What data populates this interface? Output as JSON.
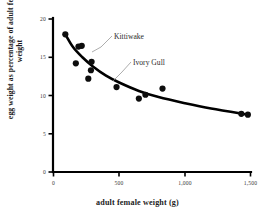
{
  "chart_data": {
    "type": "scatter",
    "title": "",
    "xlabel": "adult female weight (g)",
    "ylabel": "egg weight as percentage of adult female weight",
    "xlim": [
      0,
      1500
    ],
    "ylim": [
      0,
      20
    ],
    "xticks": [
      0,
      500,
      1000,
      1500
    ],
    "xtick_labels": [
      "0",
      "500",
      "1,000",
      "1,500"
    ],
    "yticks": [
      0,
      5,
      10,
      15,
      20
    ],
    "ytick_labels": [
      "0",
      "5",
      "10",
      "15",
      "20"
    ],
    "grid": false,
    "legend": "none",
    "points": [
      {
        "x": 90,
        "y": 18.0
      },
      {
        "x": 170,
        "y": 14.2
      },
      {
        "x": 190,
        "y": 16.4
      },
      {
        "x": 215,
        "y": 16.5
      },
      {
        "x": 265,
        "y": 12.2
      },
      {
        "x": 285,
        "y": 13.3
      },
      {
        "x": 290,
        "y": 14.4,
        "label": "Kittiwake"
      },
      {
        "x": 480,
        "y": 11.1
      },
      {
        "x": 650,
        "y": 9.6
      },
      {
        "x": 700,
        "y": 10.1,
        "label": "Ivory Gull"
      },
      {
        "x": 830,
        "y": 10.9
      },
      {
        "x": 1430,
        "y": 7.6
      },
      {
        "x": 1480,
        "y": 7.5
      }
    ],
    "trend_curve": [
      {
        "x": 90,
        "y": 18.0
      },
      {
        "x": 150,
        "y": 16.3
      },
      {
        "x": 220,
        "y": 15.0
      },
      {
        "x": 300,
        "y": 13.8
      },
      {
        "x": 400,
        "y": 12.6
      },
      {
        "x": 500,
        "y": 11.7
      },
      {
        "x": 650,
        "y": 10.6
      },
      {
        "x": 800,
        "y": 9.8
      },
      {
        "x": 1000,
        "y": 9.0
      },
      {
        "x": 1200,
        "y": 8.3
      },
      {
        "x": 1480,
        "y": 7.5
      }
    ],
    "annotations": [
      {
        "text": "Kittiwake",
        "target_x": 290,
        "target_y": 14.4
      },
      {
        "text": "Ivory Gull",
        "target_x": 700,
        "target_y": 10.1
      }
    ]
  }
}
